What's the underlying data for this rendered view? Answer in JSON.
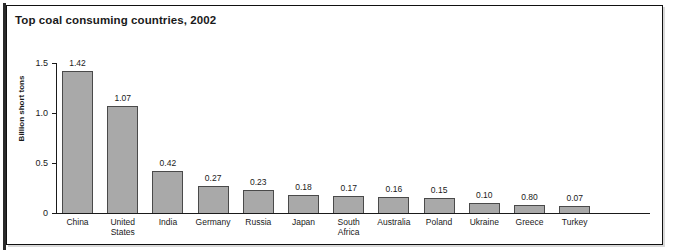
{
  "chart_data": {
    "type": "bar",
    "title": "Top coal consuming countries, 2002",
    "xlabel": "",
    "ylabel": "Billion short tons",
    "ylim": [
      0,
      1.5
    ],
    "yticks": [
      "0",
      "0.5",
      "1.0",
      "1.5"
    ],
    "ytick_values": [
      0,
      0.5,
      1.0,
      1.5
    ],
    "grid": false,
    "legend": "none",
    "categories": [
      "China",
      "United States",
      "India",
      "Germany",
      "Russia",
      "Japan",
      "South Africa",
      "Australia",
      "Poland",
      "Ukraine",
      "Greece",
      "Turkey"
    ],
    "values": [
      1.42,
      1.07,
      0.42,
      0.27,
      0.23,
      0.18,
      0.17,
      0.16,
      0.15,
      0.1,
      0.08,
      0.07
    ],
    "value_labels": [
      "1.42",
      "1.07",
      "0.42",
      "0.27",
      "0.23",
      "0.18",
      "0.17",
      "0.16",
      "0.15",
      "0.10",
      "0.80",
      "0.07"
    ],
    "bar_color": "#a9a9a9",
    "bar_edge_color": "#4a4a4a",
    "axis_color": "#1a1a1a"
  }
}
